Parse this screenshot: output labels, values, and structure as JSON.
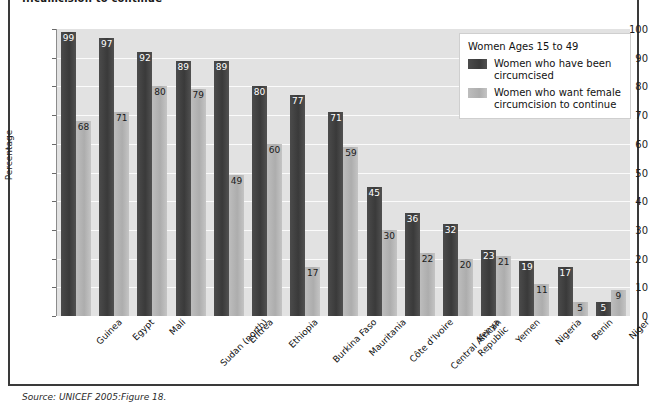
{
  "figure": {
    "title": "...cumcision to continue",
    "source": "Source: UNICEF 2005:Figure 18."
  },
  "legend": {
    "title": "Women Ages 15 to 49",
    "entries": [
      {
        "label": "Women who have been circumcised",
        "color": "#3f3f3f",
        "key": "circumcised"
      },
      {
        "label": "Women who want female circumcision to continue",
        "color": "#b3b3b3",
        "key": "want_continue"
      }
    ]
  },
  "axes": {
    "ylabel": "Percentage",
    "yticks": [
      "0",
      "10",
      "20",
      "30",
      "40",
      "50",
      "60",
      "70",
      "80",
      "90",
      "100"
    ]
  },
  "chart_data": {
    "type": "bar",
    "title": "...cumcision to continue",
    "xlabel": "",
    "ylabel": "Percentage",
    "ylim": [
      0,
      100
    ],
    "grid": true,
    "legend_position": "top-right",
    "categories": [
      "Guinea",
      "Egypt",
      "Mali",
      "Sudan (north)",
      "Eritrea",
      "Ethiopia",
      "Burkina Faso",
      "Mauritania",
      "Côte d'Ivoire",
      "Central African\nRepublic",
      "Kenya",
      "Yemen",
      "Nigeria",
      "Benin",
      "Niger"
    ],
    "series": [
      {
        "name": "Women who have been circumcised",
        "color": "#3f3f3f",
        "values": [
          99,
          97,
          92,
          89,
          89,
          80,
          77,
          71,
          45,
          36,
          32,
          23,
          19,
          17,
          5
        ]
      },
      {
        "name": "Women who want female circumcision to continue",
        "color": "#b3b3b3",
        "values": [
          68,
          71,
          80,
          79,
          49,
          60,
          17,
          59,
          30,
          22,
          20,
          21,
          11,
          5,
          9
        ]
      }
    ]
  }
}
